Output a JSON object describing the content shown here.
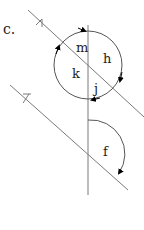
{
  "problem_label": "c.",
  "angle_labels": {
    "m": "m",
    "h": "h",
    "k": "k",
    "j": "j",
    "f": "f"
  },
  "colors": {
    "line": "#7a7a7a",
    "arc": "#555555",
    "arrow": "#000000",
    "text": "#222222"
  }
}
